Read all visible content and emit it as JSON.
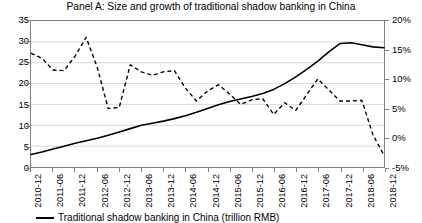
{
  "chart_data": {
    "type": "line",
    "title": "Panel A: Size and growth of traditional shadow banking in China",
    "xlabel": "",
    "ylabel": "",
    "grid": true,
    "legend_position": "bottom-left",
    "categories": [
      "2010-12",
      "2011-03",
      "2011-06",
      "2011-09",
      "2011-12",
      "2012-03",
      "2012-06",
      "2012-09",
      "2012-12",
      "2013-03",
      "2013-06",
      "2013-09",
      "2013-12",
      "2014-03",
      "2014-06",
      "2014-09",
      "2014-12",
      "2015-03",
      "2015-06",
      "2015-09",
      "2015-12",
      "2016-03",
      "2016-06",
      "2016-09",
      "2016-12",
      "2017-03",
      "2017-06",
      "2017-09",
      "2017-12",
      "2018-03",
      "2018-06",
      "2018-09",
      "2018-12"
    ],
    "x_tick_labels": [
      "2010-12",
      "2011-06",
      "2011-12",
      "2012-06",
      "2012-12",
      "2013-06",
      "2013-12",
      "2014-06",
      "2014-12",
      "2015-06",
      "2015-12",
      "2016-06",
      "2016-12",
      "2017-06",
      "2017-12",
      "2018-06",
      "2018-12"
    ],
    "y_left": {
      "ticks": [
        "0",
        "5",
        "10",
        "15",
        "20",
        "25",
        "30",
        "35"
      ],
      "values": [
        0,
        5,
        10,
        15,
        20,
        25,
        30,
        35
      ],
      "min": 0,
      "max": 35,
      "unit": "trillion RMB"
    },
    "y_right": {
      "ticks": [
        "-5%",
        "0%",
        "5%",
        "10%",
        "15%",
        "20%"
      ],
      "values": [
        -5,
        0,
        5,
        10,
        15,
        20
      ],
      "min": -5,
      "max": 20,
      "unit": "percent"
    },
    "series": [
      {
        "name": "Traditional shadow banking in China (trillion RMB)",
        "style": "solid",
        "color": "#000000",
        "axis": "left",
        "values": [
          3.0,
          3.6,
          4.3,
          5.0,
          5.7,
          6.3,
          6.9,
          7.6,
          8.4,
          9.2,
          10.0,
          10.5,
          11.0,
          11.6,
          12.3,
          13.1,
          14.0,
          14.9,
          15.7,
          16.3,
          16.9,
          17.6,
          18.6,
          20.0,
          21.6,
          23.4,
          25.4,
          27.6,
          29.6,
          29.8,
          29.3,
          28.8,
          28.6
        ]
      },
      {
        "name": "Growth rate (quarter on quarter)",
        "style": "dashed",
        "color": "#000000",
        "axis": "right",
        "values": [
          14.5,
          13.6,
          11.6,
          11.5,
          14.0,
          17.2,
          12.1,
          5.0,
          5.2,
          12.5,
          11.3,
          10.7,
          11.3,
          11.5,
          8.5,
          6.3,
          8.0,
          9.1,
          7.5,
          5.7,
          6.5,
          6.7,
          4.0,
          6.0,
          4.7,
          7.4,
          10.1,
          8.2,
          6.3,
          6.3,
          6.4,
          0.5,
          -3.0
        ]
      }
    ]
  },
  "legend": {
    "entries": [
      {
        "label": "Traditional shadow banking in China (trillion RMB)"
      }
    ]
  }
}
